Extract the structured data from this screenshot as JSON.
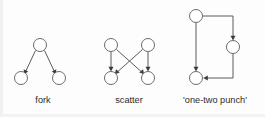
{
  "figure": {
    "width": 265,
    "height": 117,
    "background_color": "#fdfdfd",
    "node_stroke_color": "#6b6b6b",
    "node_fill_color": "#ffffff",
    "edge_color": "#5a5a5a",
    "arrow_color": "#3c3c3c",
    "caption_color": "#2b2b2b"
  },
  "diagrams": [
    {
      "id": "fork",
      "caption": "fork",
      "caption_x": 43,
      "caption_y": 103,
      "nodes": [
        {
          "name": "fork-node-top",
          "cx": 40,
          "cy": 45,
          "r": 6.5
        },
        {
          "name": "fork-node-bottom-left",
          "cx": 21,
          "cy": 78,
          "r": 6.5
        },
        {
          "name": "fork-node-bottom-right",
          "cx": 59,
          "cy": 78,
          "r": 6.5
        }
      ],
      "edges": [
        {
          "name": "fork-edge-top-to-bottom-left",
          "path": "M 35.5 50.5 L 25.2 72.5",
          "arrow_x": 24.0,
          "arrow_y": 74.6,
          "arrow_angle": 115
        },
        {
          "name": "fork-edge-top-to-bottom-right",
          "path": "M 44.5 50.5 L 54.8 72.5",
          "arrow_x": 56.0,
          "arrow_y": 74.6,
          "arrow_angle": 65
        }
      ]
    },
    {
      "id": "scatter",
      "caption": "scatter",
      "caption_x": 129,
      "caption_y": 103,
      "nodes": [
        {
          "name": "scatter-node-top-left",
          "cx": 111,
          "cy": 45,
          "r": 6.5
        },
        {
          "name": "scatter-node-top-right",
          "cx": 148,
          "cy": 45,
          "r": 6.5
        },
        {
          "name": "scatter-node-bottom-left",
          "cx": 111,
          "cy": 78,
          "r": 6.5
        },
        {
          "name": "scatter-node-bottom-right",
          "cx": 148,
          "cy": 78,
          "r": 6.5
        }
      ],
      "edges": [
        {
          "name": "scatter-edge-top-left-to-bottom-left",
          "path": "M 111 51.5 L 111 69.0",
          "arrow_x": 111,
          "arrow_y": 71.4,
          "arrow_angle": 90
        },
        {
          "name": "scatter-edge-top-right-to-bottom-right",
          "path": "M 148 51.5 L 148 69.0",
          "arrow_x": 148,
          "arrow_y": 71.4,
          "arrow_angle": 90
        },
        {
          "name": "scatter-edge-top-left-to-bottom-right",
          "path": "M 116.5 49.5 L 142.8 73.0",
          "arrow_x": 144.2,
          "arrow_y": 74.3,
          "arrow_angle": 48
        },
        {
          "name": "scatter-edge-top-right-to-bottom-left",
          "path": "M 142.5 49.5 L 116.2 73.0",
          "arrow_x": 114.8,
          "arrow_y": 74.3,
          "arrow_angle": 132
        }
      ]
    },
    {
      "id": "one-two-punch",
      "caption": "'one-two punch'",
      "caption_x": 215,
      "caption_y": 103,
      "nodes": [
        {
          "name": "punch-node-top-left",
          "cx": 196,
          "cy": 16,
          "r": 6.5
        },
        {
          "name": "punch-node-mid-right",
          "cx": 233,
          "cy": 47,
          "r": 6.5
        },
        {
          "name": "punch-node-bottom-left",
          "cx": 196,
          "cy": 78,
          "r": 6.5
        }
      ],
      "edges": [
        {
          "name": "punch-edge-top-to-mid-right",
          "path": "M 202.5 16 L 233 16 L 233 38.0",
          "arrow_x": 233,
          "arrow_y": 40.4,
          "arrow_angle": 90
        },
        {
          "name": "punch-edge-top-to-bottom-left",
          "path": "M 196 22.5 L 196 69.0",
          "arrow_x": 196,
          "arrow_y": 71.4,
          "arrow_angle": 90
        },
        {
          "name": "punch-edge-mid-right-to-bottom",
          "path": "M 233 53.5 L 233 78 L 205.5 78",
          "arrow_x": 203.2,
          "arrow_y": 78,
          "arrow_angle": 180
        }
      ]
    }
  ]
}
